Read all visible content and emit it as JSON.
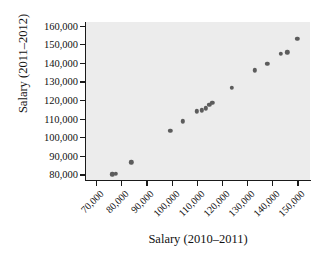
{
  "chart_data": {
    "type": "scatter",
    "title": "",
    "xlabel": "Salary (2010–2011)",
    "ylabel": "Salary (2011–2012)",
    "xlim": [
      66000,
      155000
    ],
    "ylim": [
      77000,
      162000
    ],
    "grid": false,
    "legend": null,
    "xticks": [
      "70,000",
      "80,000",
      "90,000",
      "100,000",
      "110,000",
      "120,000",
      "130,000",
      "140,000",
      "150,000"
    ],
    "xtick_values": [
      70000,
      80000,
      90000,
      100000,
      110000,
      120000,
      130000,
      140000,
      150000
    ],
    "yticks": [
      "80,000",
      "90,000",
      "100,000",
      "110,000",
      "120,000",
      "130,000",
      "140,000",
      "150,000",
      "160,000"
    ],
    "ytick_values": [
      80000,
      90000,
      100000,
      110000,
      120000,
      130000,
      140000,
      150000,
      160000
    ],
    "marker_color": "#5c5c5c",
    "panel_color": "#ececec",
    "points": [
      {
        "x": 76500,
        "y": 80000
      },
      {
        "x": 77800,
        "y": 80200
      },
      {
        "x": 84000,
        "y": 86500
      },
      {
        "x": 99500,
        "y": 103500
      },
      {
        "x": 104500,
        "y": 108500
      },
      {
        "x": 110000,
        "y": 114000
      },
      {
        "x": 112000,
        "y": 114500
      },
      {
        "x": 113500,
        "y": 115500
      },
      {
        "x": 115000,
        "y": 117500
      },
      {
        "x": 116200,
        "y": 118500
      },
      {
        "x": 124000,
        "y": 126500
      },
      {
        "x": 133000,
        "y": 136000
      },
      {
        "x": 138000,
        "y": 139500
      },
      {
        "x": 143500,
        "y": 145000
      },
      {
        "x": 146000,
        "y": 145700
      },
      {
        "x": 150000,
        "y": 153000
      }
    ]
  }
}
